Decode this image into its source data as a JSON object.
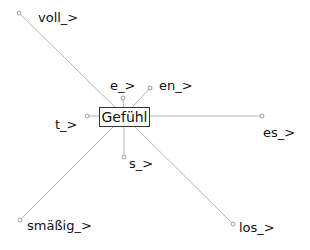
{
  "diagram": {
    "type": "word-network",
    "center": {
      "label": "Gefühl",
      "x": 124,
      "y": 116
    },
    "edge_color": "#b5b5b5",
    "nodes": [
      {
        "id": "voll",
        "label": "voll_>",
        "dot": [
          19,
          13
        ],
        "lx": 38,
        "ly": 11
      },
      {
        "id": "e",
        "label": "e_>",
        "dot": [
          123,
          98
        ],
        "lx": 110,
        "ly": 79
      },
      {
        "id": "en",
        "label": "en_>",
        "dot": [
          150,
          88
        ],
        "lx": 159,
        "ly": 79
      },
      {
        "id": "t",
        "label": "t_>",
        "dot": [
          87,
          116
        ],
        "lx": 55,
        "ly": 118
      },
      {
        "id": "es",
        "label": "es_>",
        "dot": [
          262,
          116
        ],
        "lx": 263,
        "ly": 126
      },
      {
        "id": "s",
        "label": "s_>",
        "dot": [
          124,
          157
        ],
        "lx": 129,
        "ly": 157
      },
      {
        "id": "smassig",
        "label": "smäßig_>",
        "dot": [
          20,
          220
        ],
        "lx": 27,
        "ly": 219
      },
      {
        "id": "los",
        "label": "los_>",
        "dot": [
          233,
          224
        ],
        "lx": 239,
        "ly": 221
      }
    ]
  }
}
